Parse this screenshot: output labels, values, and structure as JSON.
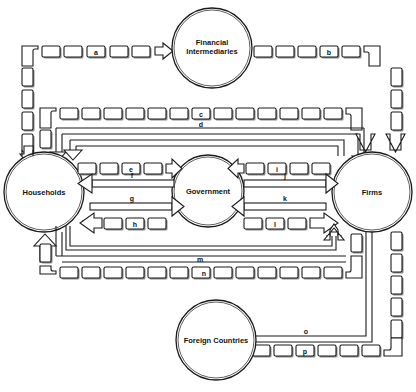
{
  "diagram": {
    "type": "circular-flow",
    "nodes": {
      "financial": {
        "label_line1": "Financial",
        "label_line2": "Intermediaries"
      },
      "households": {
        "label": "Households"
      },
      "government": {
        "label": "Government"
      },
      "firms": {
        "label": "Firms"
      },
      "foreign": {
        "label": "Foreign Countries"
      }
    },
    "flows": {
      "a": "a",
      "b": "b",
      "c": "c",
      "d": "d",
      "e": "e",
      "f": "f",
      "g": "g",
      "h": "h",
      "i": "i",
      "j": "j",
      "k": "k",
      "l": "l",
      "m": "m",
      "n": "n",
      "o": "o",
      "p": "p"
    },
    "legend_note": "Dashed (block) channels denote money flows; solid channels denote real (goods/services) flows"
  }
}
